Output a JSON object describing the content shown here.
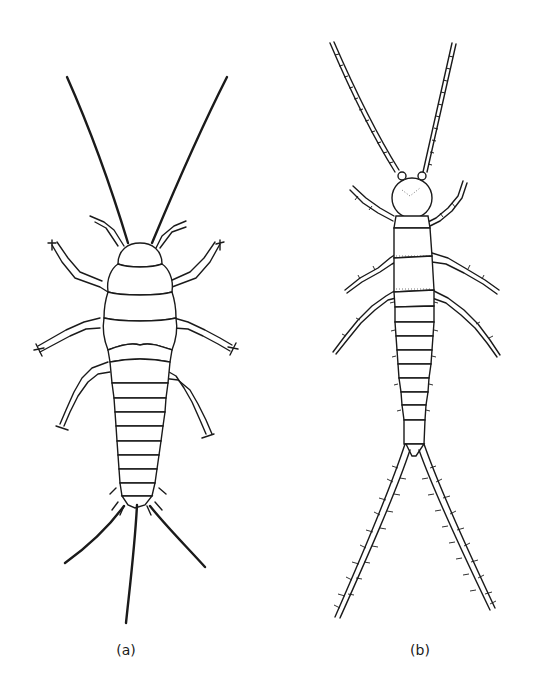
{
  "figure": {
    "panels": [
      {
        "id": "a",
        "label": "(a)",
        "subject": "insect with long smooth antennae, three thoracic segments, ten abdominal segments and three tail filaments"
      },
      {
        "id": "b",
        "label": "(b)",
        "subject": "insect with beaded antennae, rounded head, spiny legs and two long bristly cerci"
      }
    ]
  }
}
